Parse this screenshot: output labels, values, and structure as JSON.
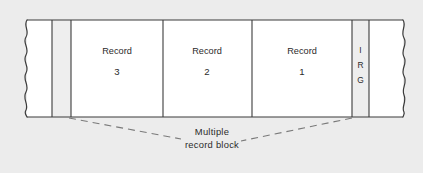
{
  "figure": {
    "kind": "magnetic-tape-blocking-diagram",
    "background_color": "#ececec",
    "tape_fill": "#ffffff",
    "gap_fill": "#eeeeee",
    "line_color": "#3b3b3b",
    "text_color": "#2b2b2b",
    "dash_color": "#7a7a7a"
  },
  "tape": {
    "left_torn_edge_label": "torn-edge-left",
    "right_torn_edge_label": "torn-edge-right",
    "cells": [
      {
        "id": "gap-left",
        "type": "gap",
        "label": "",
        "x": 52,
        "width": 19
      },
      {
        "id": "record-3",
        "type": "record",
        "label": "Record",
        "value": "3",
        "x": 71,
        "width": 92
      },
      {
        "id": "record-2",
        "type": "record",
        "label": "Record",
        "value": "2",
        "x": 163,
        "width": 89
      },
      {
        "id": "record-1",
        "type": "record",
        "label": "Record",
        "value": "1",
        "x": 252,
        "width": 100
      },
      {
        "id": "gap-irg",
        "type": "gap",
        "label": "IRG",
        "letters": [
          "I",
          "R",
          "G"
        ],
        "x": 352,
        "width": 17
      }
    ]
  },
  "callout": {
    "caption_line_1": "Multiple",
    "caption_line_2": "record block",
    "leader_left": "dashed-leader-left",
    "leader_right": "dashed-leader-right"
  }
}
